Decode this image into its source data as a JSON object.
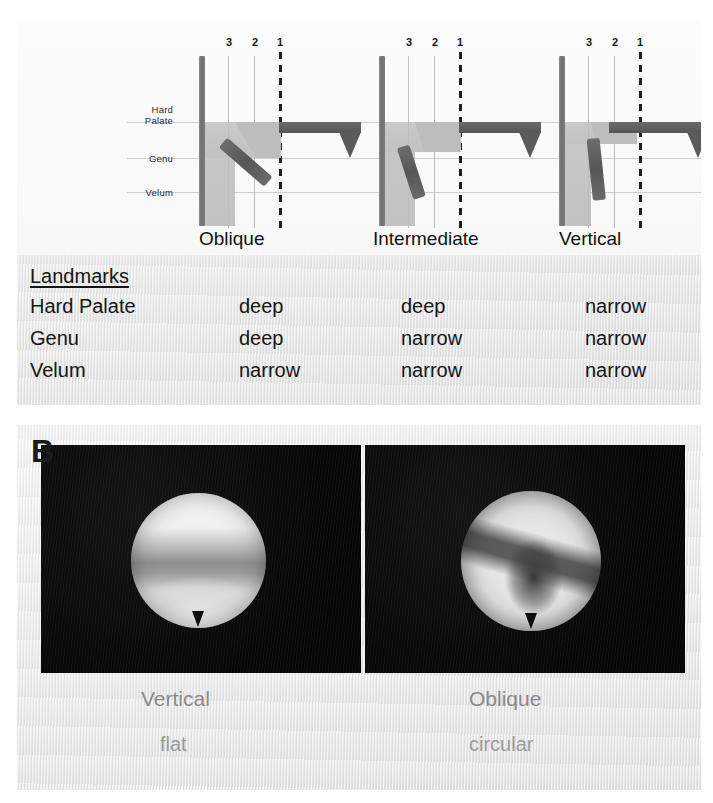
{
  "figure": {
    "panel_a_letter": "A",
    "panel_b_letter": "B"
  },
  "panel_a": {
    "landmark_axis_labels": [
      "Hard\nPalate",
      "Genu",
      "Velum"
    ],
    "guide_numbers": [
      "3",
      "2",
      "1"
    ],
    "schematics": [
      {
        "caption": "Oblique"
      },
      {
        "caption": "Intermediate"
      },
      {
        "caption": "Vertical"
      }
    ],
    "table": {
      "title": "Landmarks",
      "row_labels": [
        "Hard Palate",
        "Genu",
        "Velum"
      ],
      "columns": [
        "Oblique",
        "Intermediate",
        "Vertical"
      ],
      "rows": [
        [
          "deep",
          "deep",
          "narrow"
        ],
        [
          "deep",
          "narrow",
          "narrow"
        ],
        [
          "narrow",
          "narrow",
          "narrow"
        ]
      ]
    }
  },
  "panel_b": {
    "images": [
      {
        "caption": "Vertical",
        "subcaption": "flat"
      },
      {
        "caption": "Oblique",
        "subcaption": "circular"
      }
    ]
  },
  "colors": {
    "panel_background": "#eceaea",
    "schematic_field": "#fbfbfb",
    "airway_gray": "#c7c7c7",
    "structure_dark": "#5a5a5a",
    "wall_bar": "#7d7d7d",
    "guide_line": "#b9bec3",
    "landmark_line": "#c9cfd4",
    "text_dark": "#151515",
    "endoscope_background": "#0c0c0c",
    "endoscope_caption": "#8a8a8a"
  }
}
